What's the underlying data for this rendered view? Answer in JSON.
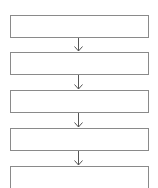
{
  "flowchart": {
    "boxes": [
      {
        "label": ""
      },
      {
        "label": ""
      },
      {
        "label": ""
      },
      {
        "label": ""
      },
      {
        "label": ""
      }
    ],
    "connector": "down-arrow",
    "colors": {
      "border": "#8a8a8a",
      "arrow": "#555555",
      "background": "#ffffff"
    }
  }
}
